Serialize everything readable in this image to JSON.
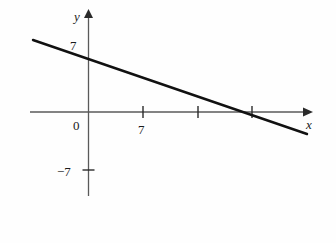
{
  "figure": {
    "type": "line-graph",
    "background_color": "#fefefe",
    "ink_color": "#1a1a1a",
    "axis_color": "#4a4a4a"
  },
  "axes": {
    "x_axis_label": "x",
    "y_axis_label": "y",
    "origin_label": "0",
    "x_ticks": [
      {
        "value": 7,
        "label": "7",
        "px": 143
      },
      {
        "value": 14,
        "label": "",
        "px": 198
      },
      {
        "value": 21,
        "label": "",
        "px": 252
      }
    ],
    "y_ticks": [
      {
        "value": 7,
        "label": "7",
        "px": 57
      },
      {
        "value": -7,
        "label": "−7",
        "px": 170
      }
    ],
    "x_axis_pixel_y": 112,
    "y_axis_pixel_x": 88,
    "x_axis_start_px": 30,
    "x_axis_end_px": 312,
    "y_axis_start_px": 10,
    "y_axis_end_px": 196
  },
  "chart_data": {
    "type": "line",
    "title": "",
    "xlabel": "x",
    "ylabel": "y",
    "grid": false,
    "legend": null,
    "xlim": [
      -7.5,
      28
    ],
    "ylim": [
      -10.5,
      13
    ],
    "x_tick_labels": [
      "7"
    ],
    "y_tick_labels": [
      "7",
      "−7"
    ],
    "series": [
      {
        "name": "line",
        "equation": "y = -x/3 + 7",
        "slope": -0.3333,
        "y_intercept": 7,
        "x_intercept": 21,
        "x": [
          -7,
          28
        ],
        "y": [
          9.333,
          -2.333
        ],
        "pixel_start": {
          "x": 33,
          "y": 40
        },
        "pixel_end": {
          "x": 307,
          "y": 134
        },
        "color": "#111111",
        "width": 2.4
      }
    ]
  }
}
